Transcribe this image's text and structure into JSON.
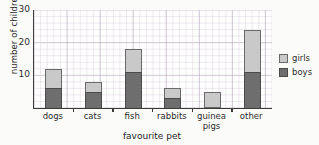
{
  "chart_data": {
    "type": "bar",
    "title": "",
    "xlabel": "favourite pet",
    "ylabel": "number of children",
    "categories": [
      "dogs",
      "cats",
      "fish",
      "rabbits",
      "guinea pigs",
      "other"
    ],
    "category_lines": [
      [
        "dogs"
      ],
      [
        "cats"
      ],
      [
        "fish"
      ],
      [
        "rabbits"
      ],
      [
        "guinea",
        "pigs"
      ],
      [
        "other"
      ]
    ],
    "series": [
      {
        "name": "boys",
        "color": "#6e6e6e",
        "values": [
          6,
          5,
          11,
          3,
          0,
          11
        ]
      },
      {
        "name": "girls",
        "color": "#c9c9c9",
        "values": [
          6,
          3,
          7,
          3,
          5,
          13
        ]
      }
    ],
    "totals": [
      12,
      8,
      18,
      6,
      5,
      24
    ],
    "stacked": true,
    "stack_order": [
      "boys",
      "girls"
    ],
    "ylim": [
      0,
      30
    ],
    "yticks": [
      10,
      20,
      30
    ],
    "ytick_labels": [
      "10",
      "20",
      "30"
    ],
    "y_minor_step": 2,
    "grid": true,
    "legend_position": "right"
  },
  "legend": {
    "items": [
      {
        "label": "girls",
        "key": "girls"
      },
      {
        "label": "boys",
        "key": "boys"
      }
    ]
  },
  "axis": {
    "y_title": "number of children",
    "x_title": "favourite pet"
  }
}
